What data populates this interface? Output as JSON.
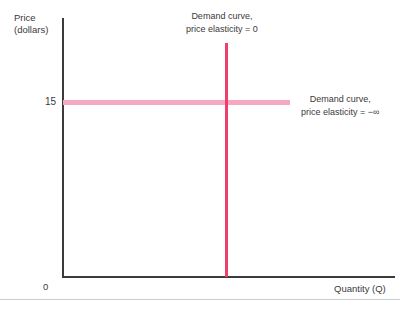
{
  "chart_data": {
    "type": "line",
    "title": "",
    "xlabel": "Quantity (Q)",
    "ylabel": "Price (dollars)",
    "ylabel_line1": "Price",
    "ylabel_line2": "(dollars)",
    "origin_label": "0",
    "y_tick_labels": [
      "15"
    ],
    "x_tick_labels": [],
    "grid": false,
    "legend_position": "inline-annotations",
    "series": [
      {
        "name": "Perfectly inelastic demand curve",
        "orientation": "vertical",
        "elasticity": "0",
        "color": "#ef3e6b",
        "annotation_line1": "Demand curve,",
        "annotation_line2": "price elasticity = 0"
      },
      {
        "name": "Perfectly elastic demand curve",
        "orientation": "horizontal",
        "price_level": 15,
        "elasticity": "-∞",
        "color": "#f5a8bf",
        "annotation_line1": "Demand curve,",
        "annotation_line2": "price elasticity = −∞"
      }
    ]
  },
  "axes": {
    "y_title_line1": "Price",
    "y_title_line2": "(dollars)",
    "x_title": "Quantity (Q)",
    "origin": "0",
    "price_tick": "15",
    "axis_color": "#3b3b3b"
  },
  "annotations": {
    "vertical_curve_line1": "Demand curve,",
    "vertical_curve_line2": "price elasticity = 0",
    "horizontal_curve_line1": "Demand curve,",
    "horizontal_curve_line2": "price elasticity = −∞"
  },
  "colors": {
    "inelastic_curve": "#ef3e6b",
    "elastic_curve": "#f5a8bf",
    "axis": "#3b3b3b",
    "text": "#3a3a3a",
    "rule": "#c9cdd1",
    "background": "#ffffff"
  }
}
